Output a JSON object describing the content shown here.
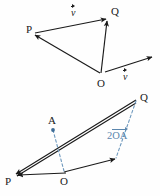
{
  "figure": {
    "background_color": "#fefefe",
    "stroke_color": "#1a1a1a",
    "accent_color": "#5b86ad",
    "panels": [
      {
        "id": "upper-panel",
        "name": "triangle-opq-with-free-vector",
        "points": [
          {
            "id": "P",
            "label": "P",
            "x": 28,
            "y": 30
          },
          {
            "id": "Q",
            "label": "Q",
            "x": 110,
            "y": 14
          },
          {
            "id": "O",
            "label": "O",
            "x": 100,
            "y": 77
          }
        ],
        "arrows": [
          {
            "name": "arrow-p-to-q",
            "from": "P",
            "to": "Q"
          },
          {
            "name": "arrow-o-to-p",
            "from": "O",
            "to": "P"
          },
          {
            "name": "arrow-o-to-q",
            "from": "O",
            "to": "Q"
          },
          {
            "name": "arrow-free-vector-v",
            "from": "O",
            "to": "free-tip"
          }
        ],
        "vector_labels": [
          {
            "name": "vector-label-v-top",
            "symbol": "v",
            "x": 71,
            "y": 5
          },
          {
            "name": "vector-label-v-free",
            "symbol": "v",
            "x": 122,
            "y": 69
          }
        ]
      },
      {
        "id": "lower-panel",
        "name": "triangle-poq-with-midpoint-a",
        "points": [
          {
            "id": "P",
            "label": "P",
            "x": 8,
            "y": 178
          },
          {
            "id": "O",
            "label": "O",
            "x": 63,
            "y": 178
          },
          {
            "id": "A",
            "label": "A",
            "x": 50,
            "y": 121
          },
          {
            "id": "Q",
            "label": "Q",
            "x": 139,
            "y": 96
          }
        ],
        "arrows": [
          {
            "name": "arrow-q-to-p-upper",
            "from": "Q",
            "to": "P"
          },
          {
            "name": "arrow-o-to-p",
            "from": "O",
            "to": "P"
          },
          {
            "name": "arrow-q-to-p-lower",
            "from": "Q",
            "to": "P"
          },
          {
            "name": "arrow-o-to-translated-tip",
            "from": "O",
            "to": "translated-tip"
          }
        ],
        "dashed_segments": [
          {
            "name": "dashed-a-to-o",
            "from": "A",
            "to": "O"
          },
          {
            "name": "dashed-q-to-translated-tip",
            "from": "Q",
            "to": "translated-tip"
          }
        ],
        "scaled_vector_label": {
          "name": "scaled-vector-label",
          "coefficient": "2",
          "vector": "OA",
          "x": 107,
          "y": 128
        }
      }
    ]
  }
}
